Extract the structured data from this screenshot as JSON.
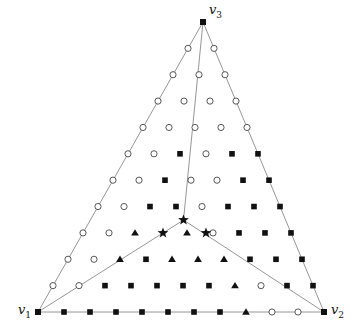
{
  "figure": {
    "type": "triangular-lattice-partition-diagram",
    "background": "#ffffff",
    "line_color": "#8a8a8a",
    "marker_color": "#111111",
    "width": 350,
    "height": 332
  },
  "vertices": [
    {
      "id": "v1",
      "label": "v",
      "subscript": "1",
      "x": 38,
      "y": 312,
      "label_x": 18,
      "label_y": 314,
      "marker": "square"
    },
    {
      "id": "v2",
      "label": "v",
      "subscript": "2",
      "x": 324,
      "y": 312,
      "label_x": 331,
      "label_y": 314,
      "marker": "square"
    },
    {
      "id": "v3",
      "label": "v",
      "subscript": "3",
      "x": 203,
      "y": 22,
      "label_x": 209,
      "label_y": 14,
      "marker": "square"
    }
  ],
  "lattice": {
    "divisions": 11,
    "origin_x": 38,
    "origin_y": 312,
    "dx": 26.0,
    "dy": 26.36,
    "description": "Barycentric triangular grid of 11 subdivisions per side; nodes at integer barycentric coordinates (i,j,k) with i+j+k=11."
  },
  "steiner_point": {
    "x": 183.5,
    "y": 220.0
  },
  "internal_boundaries": [
    {
      "name": "branch-to-v3",
      "from": [
        183.5,
        220.0
      ],
      "to": [
        203,
        22
      ]
    },
    {
      "name": "branch-to-v1",
      "from": [
        183.5,
        220.0
      ],
      "to": [
        38,
        312
      ]
    },
    {
      "name": "branch-to-v2",
      "from": [
        183.5,
        220.0
      ],
      "to": [
        324,
        312
      ]
    }
  ],
  "markers": {
    "legend": [
      {
        "symbol": "filled-square",
        "name": "filled-square-marker",
        "color": "#111111",
        "size": 6
      },
      {
        "symbol": "filled-triangle",
        "name": "filled-triangle-marker",
        "color": "#111111",
        "size": 6
      },
      {
        "symbol": "open-circle",
        "name": "open-circle-marker",
        "color": "#111111",
        "size": 5
      },
      {
        "symbol": "filled-star",
        "name": "filled-star-marker",
        "color": "#111111",
        "size": 7
      }
    ],
    "star_points": [
      {
        "x": 183.5,
        "y": 220.0
      },
      {
        "x": 163.0,
        "y": 233.0
      },
      {
        "x": 206.0,
        "y": 233.0
      }
    ],
    "squares": [
      [
        38,
        312
      ],
      [
        64,
        312
      ],
      [
        90,
        312
      ],
      [
        116,
        312
      ],
      [
        142,
        312
      ],
      [
        168,
        312
      ],
      [
        51,
        286
      ],
      [
        77,
        286
      ],
      [
        103,
        286
      ],
      [
        129,
        286
      ],
      [
        155,
        286
      ],
      [
        64,
        259
      ],
      [
        90,
        259
      ],
      [
        116,
        259
      ],
      [
        142,
        259
      ],
      [
        77,
        233
      ],
      [
        103,
        233
      ],
      [
        90,
        207
      ],
      [
        311,
        312
      ],
      [
        298,
        286
      ],
      [
        285,
        286
      ],
      [
        272,
        259
      ],
      [
        298,
        259
      ],
      [
        259,
        233
      ],
      [
        285,
        233
      ],
      [
        246,
        207
      ],
      [
        272,
        207
      ],
      [
        233,
        181
      ],
      [
        259,
        181
      ],
      [
        220,
        154
      ],
      [
        246,
        154
      ],
      [
        203,
        22
      ],
      [
        190,
        48
      ],
      [
        216,
        48
      ],
      [
        177,
        74
      ],
      [
        190,
        74
      ],
      [
        164,
        101
      ],
      [
        190,
        101
      ],
      [
        151,
        127
      ],
      [
        177,
        127
      ],
      [
        138,
        154
      ],
      [
        164,
        154
      ],
      [
        190,
        127
      ],
      [
        190,
        154
      ],
      [
        125,
        181
      ],
      [
        151,
        181
      ],
      [
        203,
        48
      ],
      [
        190,
        22
      ]
    ],
    "triangles": [
      [
        112,
        207
      ],
      [
        125,
        233
      ],
      [
        138,
        207
      ],
      [
        151,
        207
      ],
      [
        164,
        181
      ],
      [
        99,
        233
      ],
      [
        112,
        259
      ],
      [
        125,
        259
      ],
      [
        151,
        259
      ],
      [
        164,
        259
      ],
      [
        190,
        286
      ],
      [
        203,
        286
      ],
      [
        216,
        286
      ],
      [
        229,
        286
      ],
      [
        177,
        286
      ],
      [
        190,
        259
      ],
      [
        216,
        259
      ],
      [
        242,
        259
      ],
      [
        229,
        181
      ],
      [
        242,
        155
      ],
      [
        255,
        181
      ],
      [
        216,
        181
      ],
      [
        203,
        181
      ],
      [
        268,
        207
      ],
      [
        255,
        207
      ]
    ]
  },
  "caption": ""
}
